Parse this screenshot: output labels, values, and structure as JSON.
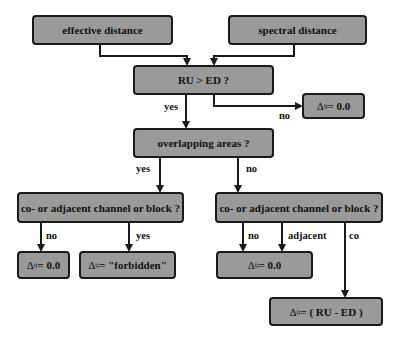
{
  "diagram": {
    "type": "flowchart",
    "colors": {
      "box_fill": "#9a9a9a",
      "box_border": "#1a1a1a",
      "line": "#1a1a1a",
      "background": "#ffffff"
    },
    "nodes": {
      "effective_distance": {
        "label": "effective distance"
      },
      "spectral_distance": {
        "label": "spectral distance"
      },
      "ru_gt_ed": {
        "label": "RU > ED ?"
      },
      "result_no_overlap": {
        "symbol": "Δ",
        "sub": "ij",
        "value": " = 0.0"
      },
      "overlapping_areas": {
        "label": "overlapping areas ?"
      },
      "channel_left": {
        "label": "co- or adjacent channel or block ?"
      },
      "channel_right": {
        "label": "co- or adjacent channel or block ?"
      },
      "result_left_no": {
        "symbol": "Δ",
        "sub": "ij",
        "value": " = 0.0"
      },
      "result_left_yes": {
        "symbol": "Δ",
        "sub": "ij",
        "value": " = \"forbidden\""
      },
      "result_right_no_adj": {
        "symbol": "Δ",
        "sub": "ij",
        "value": " = 0.0"
      },
      "result_right_co": {
        "symbol": "Δ",
        "sub": "ij",
        "value": " = ( RU - ED )"
      }
    },
    "edge_labels": {
      "ru_yes": "yes",
      "ru_no": "no",
      "overlap_yes": "yes",
      "overlap_no": "no",
      "left_no": "no",
      "left_yes": "yes",
      "right_no": "no",
      "right_adjacent": "adjacent",
      "right_co": "co"
    }
  }
}
